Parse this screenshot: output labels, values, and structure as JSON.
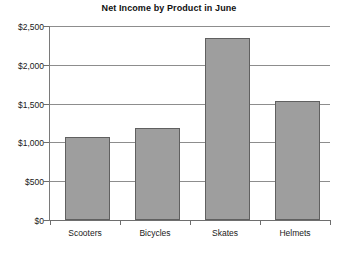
{
  "chart_data": {
    "type": "bar",
    "title": "Net Income by Product in June",
    "xlabel": "",
    "ylabel": "",
    "categories": [
      "Scooters",
      "Bicycles",
      "Skates",
      "Helmets"
    ],
    "values": [
      1070,
      1190,
      2350,
      1530
    ],
    "ylim": [
      0,
      2500
    ],
    "ytick_values": [
      0,
      500,
      1000,
      1500,
      2000,
      2500
    ],
    "ytick_labels": [
      "$0",
      "$500",
      "$1,000",
      "$1,500",
      "$2,000",
      "$2,500"
    ],
    "grid": "horizontal",
    "legend": "none",
    "series": [
      {
        "name": "Net Income",
        "values": [
          1070,
          1190,
          2350,
          1530
        ],
        "color": "#9e9e9e",
        "border_color": "#606060"
      }
    ],
    "axis_color": "#6e6e6e",
    "gridline_color": "#8d8d8d",
    "background": "#ffffff"
  }
}
